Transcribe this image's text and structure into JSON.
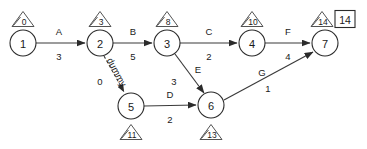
{
  "diagram": {
    "type": "activity-on-arrow-network",
    "nodes": [
      {
        "id": "n1",
        "label": "1",
        "cx": 23,
        "cy": 43,
        "r": 13
      },
      {
        "id": "n2",
        "label": "2",
        "cx": 100,
        "cy": 43,
        "r": 13
      },
      {
        "id": "n3",
        "label": "3",
        "cx": 167,
        "cy": 43,
        "r": 13
      },
      {
        "id": "n4",
        "label": "4",
        "cx": 252,
        "cy": 43,
        "r": 13
      },
      {
        "id": "n5",
        "label": "5",
        "cx": 131,
        "cy": 106,
        "r": 13
      },
      {
        "id": "n6",
        "label": "6",
        "cx": 211,
        "cy": 105,
        "r": 13
      },
      {
        "id": "n7",
        "label": "7",
        "cx": 325,
        "cy": 43,
        "r": 13
      }
    ],
    "edges": [
      {
        "id": "eA",
        "name": "A",
        "weight": "3",
        "from": "n1",
        "to": "n2",
        "style": "solid",
        "x1": 36,
        "y1": 43,
        "x2": 85,
        "y2": 43,
        "name_x": 59,
        "name_y": 31,
        "weight_x": 59,
        "weight_y": 56
      },
      {
        "id": "eB",
        "name": "B",
        "weight": "5",
        "from": "n2",
        "to": "n3",
        "style": "solid",
        "x1": 113,
        "y1": 43,
        "x2": 152,
        "y2": 43,
        "name_x": 133,
        "name_y": 31,
        "weight_x": 133,
        "weight_y": 56
      },
      {
        "id": "eC",
        "name": "C",
        "weight": "2",
        "from": "n3",
        "to": "n4",
        "style": "solid",
        "x1": 180,
        "y1": 43,
        "x2": 237,
        "y2": 43,
        "name_x": 209,
        "name_y": 31,
        "weight_x": 209,
        "weight_y": 56
      },
      {
        "id": "eF",
        "name": "F",
        "weight": "4",
        "from": "n4",
        "to": "n7",
        "style": "solid",
        "x1": 265,
        "y1": 43,
        "x2": 310,
        "y2": 43,
        "name_x": 288,
        "name_y": 31,
        "weight_x": 288,
        "weight_y": 56
      },
      {
        "id": "eE",
        "name": "E",
        "weight": "3",
        "from": "n3",
        "to": "n6",
        "style": "solid",
        "x1": 175,
        "y1": 54,
        "x2": 204,
        "y2": 93,
        "name_x": 198,
        "name_y": 69,
        "weight_x": 174,
        "weight_y": 81
      },
      {
        "id": "eD",
        "name": "D",
        "weight": "2",
        "from": "n5",
        "to": "n6",
        "style": "solid",
        "x1": 144,
        "y1": 106,
        "x2": 196,
        "y2": 105,
        "name_x": 170,
        "name_y": 94,
        "weight_x": 170,
        "weight_y": 119
      },
      {
        "id": "eG",
        "name": "G",
        "weight": "1",
        "from": "n6",
        "to": "n7",
        "style": "solid",
        "x1": 224,
        "y1": 100,
        "x2": 313,
        "y2": 52,
        "name_x": 262,
        "name_y": 72,
        "weight_x": 268,
        "weight_y": 88
      },
      {
        "id": "eDummy",
        "name": "dummy",
        "weight": "0",
        "from": "n2",
        "to": "n5",
        "style": "dashed",
        "x1": 104,
        "y1": 56,
        "x2": 124,
        "y2": 92,
        "name_x": 117,
        "name_y": 72,
        "name_rotate": 62,
        "weight_x": 100,
        "weight_y": 81
      }
    ],
    "time_markers": [
      {
        "id": "m1",
        "value": "0",
        "node": "n1",
        "x": 23,
        "y": 19,
        "position": "above"
      },
      {
        "id": "m2",
        "value": "3",
        "node": "n2",
        "x": 100,
        "y": 19,
        "position": "above"
      },
      {
        "id": "m3",
        "value": "8",
        "node": "n3",
        "x": 167,
        "y": 19,
        "position": "above"
      },
      {
        "id": "m4",
        "value": "10",
        "node": "n4",
        "x": 252,
        "y": 19,
        "position": "above"
      },
      {
        "id": "m7",
        "value": "14",
        "node": "n7",
        "x": 322,
        "y": 19,
        "position": "above"
      },
      {
        "id": "m5",
        "value": "11",
        "node": "n5",
        "x": 131,
        "y": 132,
        "position": "below"
      },
      {
        "id": "m6",
        "value": "13",
        "node": "n6",
        "x": 211,
        "y": 132,
        "position": "below"
      }
    ],
    "boxes": [
      {
        "id": "b7",
        "value": "14",
        "x": 345,
        "y": 19,
        "w": 20,
        "h": 17
      }
    ],
    "colors": {
      "background": "#ffffff",
      "stroke": "#2b2b2b",
      "edge": "#3a3a3a",
      "marker_stroke": "#4a4a4a",
      "text": "#1a1a1a"
    }
  }
}
